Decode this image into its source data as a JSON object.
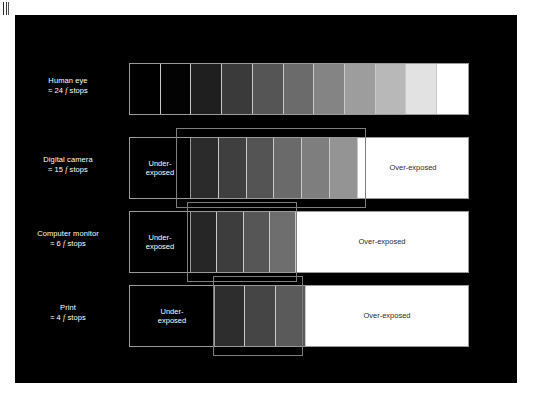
{
  "figure": {
    "background_color": "#000000",
    "page_color": "#ffffff",
    "bar_outline_color": "#9a9a9a",
    "highlight_box_color": "#7e7e7e",
    "under_exposed_label": "Under-\nexposed",
    "under_exposed_line1": "Under-",
    "under_exposed_line2": "exposed",
    "over_exposed_label": "Over-exposed",
    "rows": [
      {
        "id": "human-eye",
        "name_line1": "Human eye",
        "approx_symbol": "≈",
        "stops_value": "24",
        "f_char": "f",
        "stops_word": "stops",
        "name_line2": "≈ 24 f stops",
        "has_under_exposed": false,
        "has_over_exposed": false,
        "has_highlight_box": false,
        "segments": [
          "#000000",
          "#030303",
          "#1f1f1f",
          "#3a3a3a",
          "#555555",
          "#6b6b6b",
          "#848484",
          "#9d9d9d",
          "#b8b8b8",
          "#e2e2e2",
          "#ffffff"
        ]
      },
      {
        "id": "digital-camera",
        "name_line1": "Digital camera",
        "approx_symbol": "≈",
        "stops_value": "15",
        "f_char": "f",
        "stops_word": "stops",
        "name_line2": "≈ 15 f stops",
        "has_under_exposed": true,
        "has_over_exposed": true,
        "has_highlight_box": true,
        "segments": [
          "#2b2b2b",
          "#3f3f3f",
          "#545454",
          "#6a6a6a",
          "#7e7e7e",
          "#949494"
        ]
      },
      {
        "id": "computer-monitor",
        "name_line1": "Computer monitor",
        "approx_symbol": "≈",
        "stops_value": "6",
        "f_char": "f",
        "stops_word": "stops",
        "name_line2": "≈ 6 f stops",
        "has_under_exposed": true,
        "has_over_exposed": true,
        "has_highlight_box": true,
        "segments": [
          "#262626",
          "#3d3d3d",
          "#565656",
          "#6e6e6e"
        ]
      },
      {
        "id": "print",
        "name_line1": "Print",
        "approx_symbol": "≈",
        "stops_value": "4",
        "f_char": "f",
        "stops_word": "stops",
        "name_line2": "≈ 4 f stops",
        "has_under_exposed": true,
        "has_over_exposed": true,
        "has_highlight_box": true,
        "segments": [
          "#2d2d2d",
          "#454545",
          "#5a5a5a"
        ]
      }
    ]
  }
}
